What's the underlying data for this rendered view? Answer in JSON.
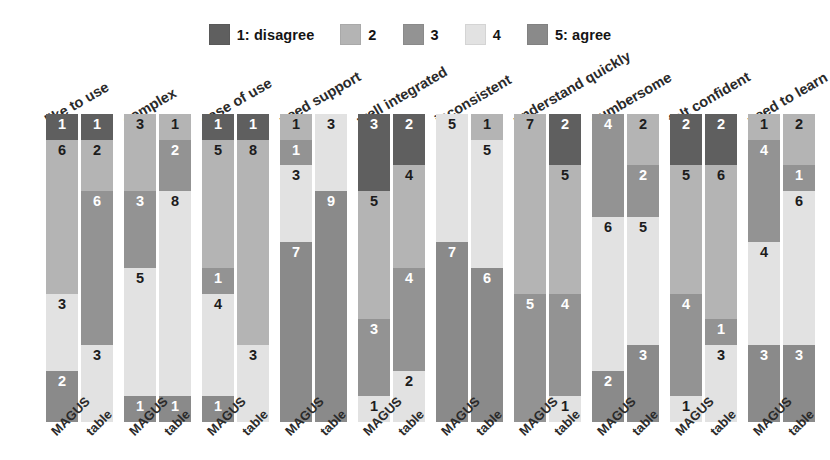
{
  "chart_data": {
    "type": "bar",
    "title": "",
    "subtitle": "",
    "xlabel": "",
    "ylabel": "",
    "orientation": "vertical",
    "stacked": true,
    "stack_order_top_to_bottom": [
      "1: disagree",
      "2",
      "3",
      "4",
      "5: agree"
    ],
    "grid": false,
    "legend_position": "top-center",
    "legend": [
      {
        "key": "1",
        "label": "1: disagree",
        "color": "#5f5f5f"
      },
      {
        "key": "2",
        "label": "2",
        "color": "#b4b4b4"
      },
      {
        "key": "3",
        "label": "3",
        "color": "#939393"
      },
      {
        "key": "4",
        "label": "4",
        "color": "#e2e2e2"
      },
      {
        "key": "5",
        "label": "5: agree",
        "color": "#8a8a8a"
      }
    ],
    "series_names": [
      "MAGUS",
      "table"
    ],
    "categories": [
      "like to use",
      "complex",
      "ease of use",
      "need support",
      "well integrated",
      "inconsistent",
      "understand quickly",
      "cumbersome",
      "felt confident",
      "need to learn"
    ],
    "total_respondents": 12,
    "groups": [
      {
        "category": "like to use",
        "bars": [
          {
            "series": "MAGUS",
            "segments": [
              {
                "key": "1",
                "value": 1
              },
              {
                "key": "2",
                "value": 6
              },
              {
                "key": "3",
                "value": 0
              },
              {
                "key": "4",
                "value": 3
              },
              {
                "key": "5",
                "value": 2
              }
            ]
          },
          {
            "series": "table",
            "segments": [
              {
                "key": "1",
                "value": 1
              },
              {
                "key": "2",
                "value": 2
              },
              {
                "key": "3",
                "value": 6
              },
              {
                "key": "4",
                "value": 3
              },
              {
                "key": "5",
                "value": 0
              }
            ]
          }
        ]
      },
      {
        "category": "complex",
        "bars": [
          {
            "series": "MAGUS",
            "segments": [
              {
                "key": "1",
                "value": 0
              },
              {
                "key": "2",
                "value": 3
              },
              {
                "key": "3",
                "value": 3
              },
              {
                "key": "4",
                "value": 5
              },
              {
                "key": "5",
                "value": 1
              }
            ]
          },
          {
            "series": "table",
            "segments": [
              {
                "key": "1",
                "value": 0
              },
              {
                "key": "2",
                "value": 1
              },
              {
                "key": "3",
                "value": 2
              },
              {
                "key": "4",
                "value": 8
              },
              {
                "key": "5",
                "value": 1
              }
            ]
          }
        ]
      },
      {
        "category": "ease of use",
        "bars": [
          {
            "series": "MAGUS",
            "segments": [
              {
                "key": "1",
                "value": 1
              },
              {
                "key": "2",
                "value": 5
              },
              {
                "key": "3",
                "value": 1
              },
              {
                "key": "4",
                "value": 4
              },
              {
                "key": "5",
                "value": 1
              }
            ]
          },
          {
            "series": "table",
            "segments": [
              {
                "key": "1",
                "value": 1
              },
              {
                "key": "2",
                "value": 8
              },
              {
                "key": "3",
                "value": 0
              },
              {
                "key": "4",
                "value": 3
              },
              {
                "key": "5",
                "value": 0
              }
            ]
          }
        ]
      },
      {
        "category": "need support",
        "bars": [
          {
            "series": "MAGUS",
            "segments": [
              {
                "key": "1",
                "value": 0
              },
              {
                "key": "2",
                "value": 1
              },
              {
                "key": "3",
                "value": 1
              },
              {
                "key": "4",
                "value": 3
              },
              {
                "key": "5",
                "value": 7
              }
            ]
          },
          {
            "series": "table",
            "segments": [
              {
                "key": "1",
                "value": 0
              },
              {
                "key": "2",
                "value": 0
              },
              {
                "key": "3",
                "value": 0
              },
              {
                "key": "4",
                "value": 3
              },
              {
                "key": "5",
                "value": 9
              }
            ]
          }
        ]
      },
      {
        "category": "well integrated",
        "bars": [
          {
            "series": "MAGUS",
            "segments": [
              {
                "key": "1",
                "value": 3
              },
              {
                "key": "2",
                "value": 5
              },
              {
                "key": "3",
                "value": 3
              },
              {
                "key": "4",
                "value": 1
              },
              {
                "key": "5",
                "value": 0
              }
            ]
          },
          {
            "series": "table",
            "segments": [
              {
                "key": "1",
                "value": 2
              },
              {
                "key": "2",
                "value": 4
              },
              {
                "key": "3",
                "value": 4
              },
              {
                "key": "4",
                "value": 2
              },
              {
                "key": "5",
                "value": 0
              }
            ]
          }
        ]
      },
      {
        "category": "inconsistent",
        "bars": [
          {
            "series": "MAGUS",
            "segments": [
              {
                "key": "1",
                "value": 0
              },
              {
                "key": "2",
                "value": 0
              },
              {
                "key": "3",
                "value": 0
              },
              {
                "key": "4",
                "value": 5
              },
              {
                "key": "5",
                "value": 7
              }
            ]
          },
          {
            "series": "table",
            "segments": [
              {
                "key": "1",
                "value": 0
              },
              {
                "key": "2",
                "value": 1
              },
              {
                "key": "3",
                "value": 0
              },
              {
                "key": "4",
                "value": 5
              },
              {
                "key": "5",
                "value": 6
              }
            ]
          }
        ]
      },
      {
        "category": "understand quickly",
        "bars": [
          {
            "series": "MAGUS",
            "segments": [
              {
                "key": "1",
                "value": 0
              },
              {
                "key": "2",
                "value": 7
              },
              {
                "key": "3",
                "value": 5
              },
              {
                "key": "4",
                "value": 0
              },
              {
                "key": "5",
                "value": 0
              }
            ]
          },
          {
            "series": "table",
            "segments": [
              {
                "key": "1",
                "value": 2
              },
              {
                "key": "2",
                "value": 5
              },
              {
                "key": "3",
                "value": 4
              },
              {
                "key": "4",
                "value": 1
              },
              {
                "key": "5",
                "value": 0
              }
            ]
          }
        ]
      },
      {
        "category": "cumbersome",
        "bars": [
          {
            "series": "MAGUS",
            "segments": [
              {
                "key": "1",
                "value": 0
              },
              {
                "key": "2",
                "value": 0
              },
              {
                "key": "3",
                "value": 4
              },
              {
                "key": "4",
                "value": 6
              },
              {
                "key": "5",
                "value": 2
              }
            ]
          },
          {
            "series": "table",
            "segments": [
              {
                "key": "1",
                "value": 0
              },
              {
                "key": "2",
                "value": 2
              },
              {
                "key": "3",
                "value": 2
              },
              {
                "key": "4",
                "value": 5
              },
              {
                "key": "5",
                "value": 3
              }
            ]
          }
        ]
      },
      {
        "category": "felt confident",
        "bars": [
          {
            "series": "MAGUS",
            "segments": [
              {
                "key": "1",
                "value": 2
              },
              {
                "key": "2",
                "value": 5
              },
              {
                "key": "3",
                "value": 4
              },
              {
                "key": "4",
                "value": 1
              },
              {
                "key": "5",
                "value": 0
              }
            ]
          },
          {
            "series": "table",
            "segments": [
              {
                "key": "1",
                "value": 2
              },
              {
                "key": "2",
                "value": 6
              },
              {
                "key": "3",
                "value": 1
              },
              {
                "key": "4",
                "value": 3
              },
              {
                "key": "5",
                "value": 0
              }
            ]
          }
        ]
      },
      {
        "category": "need to learn",
        "bars": [
          {
            "series": "MAGUS",
            "segments": [
              {
                "key": "1",
                "value": 0
              },
              {
                "key": "2",
                "value": 1
              },
              {
                "key": "3",
                "value": 4
              },
              {
                "key": "4",
                "value": 4
              },
              {
                "key": "5",
                "value": 3
              }
            ]
          },
          {
            "series": "table",
            "segments": [
              {
                "key": "1",
                "value": 0
              },
              {
                "key": "2",
                "value": 2
              },
              {
                "key": "3",
                "value": 1
              },
              {
                "key": "4",
                "value": 6
              },
              {
                "key": "5",
                "value": 3
              }
            ]
          }
        ]
      }
    ]
  },
  "layout": {
    "background": "#ffffff",
    "group_width": 78,
    "bar_width": 32,
    "bar_gap": 3,
    "plot_left": 46,
    "bar_area_height": 308,
    "max_stack_total": 12
  }
}
